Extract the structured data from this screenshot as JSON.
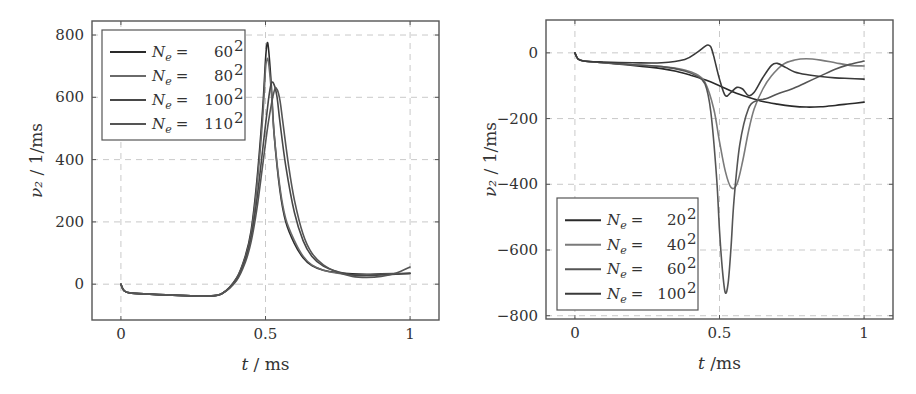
{
  "chart_data": [
    {
      "type": "line",
      "title": "",
      "xlabel": "t / ms",
      "ylabel": "ν₂ / 1/ms",
      "xlim": [
        -0.1,
        1.1
      ],
      "ylim": [
        -115,
        845
      ],
      "xticks": [
        0,
        0.5,
        1
      ],
      "xtick_labels": [
        "0",
        "0.5",
        "1"
      ],
      "yticks": [
        0,
        200,
        400,
        600,
        800
      ],
      "ytick_labels": [
        "0",
        "200",
        "400",
        "600",
        "800"
      ],
      "grid": true,
      "legend_position": "top-left",
      "series": [
        {
          "name": "N_e = 60^2",
          "legend_prefix": "N",
          "legend_sub": "e",
          "legend_eq": "=",
          "legend_base": "60",
          "legend_exp": "2",
          "color": "#2a2a2a",
          "x": [
            0,
            0.01,
            0.03,
            0.1,
            0.2,
            0.3,
            0.35,
            0.4,
            0.43,
            0.45,
            0.47,
            0.49,
            0.5,
            0.505,
            0.51,
            0.52,
            0.53,
            0.55,
            0.57,
            0.6,
            0.63,
            0.66,
            0.7,
            0.75,
            0.8,
            0.85,
            0.9,
            0.95,
            1.0
          ],
          "y": [
            0,
            -20,
            -28,
            -32,
            -36,
            -38,
            -30,
            20,
            90,
            170,
            330,
            560,
            720,
            770,
            760,
            640,
            480,
            300,
            200,
            130,
            85,
            60,
            45,
            37,
            33,
            32,
            33,
            34,
            35
          ]
        },
        {
          "name": "N_e = 80^2",
          "legend_prefix": "N",
          "legend_sub": "e",
          "legend_eq": "=",
          "legend_base": "80",
          "legend_exp": "2",
          "color": "#6a6a6a",
          "x": [
            0,
            0.01,
            0.03,
            0.1,
            0.2,
            0.3,
            0.35,
            0.4,
            0.43,
            0.45,
            0.47,
            0.49,
            0.5,
            0.505,
            0.51,
            0.52,
            0.53,
            0.55,
            0.57,
            0.6,
            0.63,
            0.66,
            0.7,
            0.75,
            0.8,
            0.85,
            0.9,
            0.95,
            1.0
          ],
          "y": [
            0,
            -20,
            -28,
            -32,
            -36,
            -38,
            -30,
            18,
            85,
            160,
            310,
            530,
            690,
            720,
            715,
            620,
            480,
            310,
            210,
            140,
            90,
            62,
            45,
            35,
            30,
            30,
            32,
            33,
            34
          ]
        },
        {
          "name": "N_e = 100^2",
          "legend_prefix": "N",
          "legend_sub": "e",
          "legend_eq": "=",
          "legend_base": "100",
          "legend_exp": "2",
          "color": "#474747",
          "x": [
            0,
            0.01,
            0.03,
            0.1,
            0.2,
            0.3,
            0.35,
            0.4,
            0.43,
            0.45,
            0.47,
            0.49,
            0.51,
            0.52,
            0.53,
            0.54,
            0.55,
            0.57,
            0.6,
            0.63,
            0.66,
            0.7,
            0.75,
            0.8,
            0.85,
            0.9,
            0.95,
            1.0
          ],
          "y": [
            0,
            -20,
            -28,
            -32,
            -36,
            -38,
            -30,
            15,
            80,
            150,
            270,
            430,
            590,
            645,
            640,
            600,
            520,
            380,
            230,
            140,
            90,
            58,
            40,
            30,
            28,
            30,
            32,
            35
          ]
        },
        {
          "name": "N_e = 110^2",
          "legend_prefix": "N",
          "legend_sub": "e",
          "legend_eq": "=",
          "legend_base": "110",
          "legend_exp": "2",
          "color": "#555555",
          "x": [
            0,
            0.01,
            0.03,
            0.1,
            0.2,
            0.3,
            0.35,
            0.4,
            0.43,
            0.45,
            0.47,
            0.49,
            0.51,
            0.53,
            0.54,
            0.55,
            0.56,
            0.58,
            0.6,
            0.63,
            0.66,
            0.7,
            0.75,
            0.8,
            0.85,
            0.9,
            0.95,
            1.0
          ],
          "y": [
            0,
            -20,
            -28,
            -32,
            -36,
            -38,
            -30,
            12,
            70,
            135,
            240,
            380,
            520,
            620,
            625,
            590,
            520,
            380,
            270,
            160,
            100,
            62,
            38,
            25,
            22,
            25,
            35,
            55
          ]
        }
      ]
    },
    {
      "type": "line",
      "title": "",
      "xlabel": "t /ms",
      "ylabel": "ν₂ / 1/ms",
      "xlim": [
        -0.1,
        1.1
      ],
      "ylim": [
        -810,
        100
      ],
      "xticks": [
        0,
        0.5,
        1
      ],
      "xtick_labels": [
        "0",
        "0.5",
        "1"
      ],
      "yticks": [
        -800,
        -600,
        -400,
        -200,
        0
      ],
      "ytick_labels": [
        "−800",
        "−600",
        "−400",
        "−200",
        "0"
      ],
      "grid": true,
      "legend_position": "bottom-left",
      "series": [
        {
          "name": "N_e = 20^2",
          "legend_prefix": "N",
          "legend_sub": "e",
          "legend_eq": "=",
          "legend_base": "20",
          "legend_exp": "2",
          "color": "#2a2a2a",
          "x": [
            0,
            0.01,
            0.03,
            0.1,
            0.2,
            0.3,
            0.35,
            0.4,
            0.45,
            0.5,
            0.55,
            0.6,
            0.65,
            0.7,
            0.75,
            0.8,
            0.85,
            0.9,
            0.95,
            1.0
          ],
          "y": [
            0,
            -18,
            -25,
            -30,
            -38,
            -48,
            -56,
            -68,
            -82,
            -100,
            -120,
            -135,
            -148,
            -156,
            -162,
            -165,
            -164,
            -160,
            -155,
            -150
          ]
        },
        {
          "name": "N_e = 40^2",
          "legend_prefix": "N",
          "legend_sub": "e",
          "legend_eq": "=",
          "legend_base": "40",
          "legend_exp": "2",
          "color": "#7a7a7a",
          "x": [
            0,
            0.01,
            0.03,
            0.1,
            0.2,
            0.3,
            0.38,
            0.42,
            0.45,
            0.48,
            0.5,
            0.52,
            0.54,
            0.56,
            0.58,
            0.6,
            0.62,
            0.65,
            0.68,
            0.72,
            0.76,
            0.8,
            0.85,
            0.9,
            0.95,
            1.0
          ],
          "y": [
            0,
            -18,
            -25,
            -30,
            -36,
            -42,
            -52,
            -65,
            -90,
            -170,
            -270,
            -360,
            -410,
            -400,
            -330,
            -240,
            -170,
            -110,
            -70,
            -35,
            -22,
            -18,
            -22,
            -30,
            -38,
            -40
          ]
        },
        {
          "name": "N_e = 60^2",
          "legend_prefix": "N",
          "legend_sub": "e",
          "legend_eq": "=",
          "legend_base": "60",
          "legend_exp": "2",
          "color": "#555555",
          "x": [
            0,
            0.01,
            0.03,
            0.1,
            0.2,
            0.3,
            0.38,
            0.42,
            0.45,
            0.47,
            0.49,
            0.5,
            0.51,
            0.52,
            0.53,
            0.54,
            0.55,
            0.57,
            0.6,
            0.63,
            0.66,
            0.7,
            0.75,
            0.8,
            0.85,
            0.9,
            0.95,
            1.0
          ],
          "y": [
            0,
            -18,
            -25,
            -30,
            -36,
            -42,
            -55,
            -70,
            -95,
            -180,
            -380,
            -540,
            -660,
            -730,
            -700,
            -590,
            -450,
            -280,
            -170,
            -145,
            -140,
            -125,
            -110,
            -90,
            -70,
            -50,
            -35,
            -25
          ]
        },
        {
          "name": "N_e = 100^2",
          "legend_prefix": "N",
          "legend_sub": "e",
          "legend_eq": "=",
          "legend_base": "100",
          "legend_exp": "2",
          "color": "#3a3a3a",
          "x": [
            0,
            0.01,
            0.03,
            0.1,
            0.2,
            0.3,
            0.38,
            0.42,
            0.45,
            0.46,
            0.47,
            0.48,
            0.5,
            0.52,
            0.54,
            0.56,
            0.58,
            0.6,
            0.62,
            0.65,
            0.68,
            0.7,
            0.73,
            0.76,
            0.8,
            0.85,
            0.9,
            0.95,
            1.0
          ],
          "y": [
            0,
            -18,
            -25,
            -28,
            -30,
            -30,
            -20,
            0,
            20,
            24,
            18,
            -10,
            -80,
            -130,
            -120,
            -105,
            -110,
            -130,
            -120,
            -75,
            -38,
            -32,
            -45,
            -58,
            -66,
            -72,
            -76,
            -78,
            -80
          ]
        }
      ]
    }
  ]
}
